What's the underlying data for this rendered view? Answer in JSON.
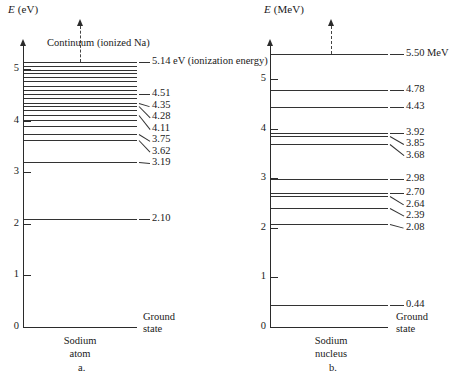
{
  "figure": {
    "background": "#ffffff",
    "line_color": "#333333",
    "axis_color": "#2b2b2b"
  },
  "chart_data": [
    {
      "type": "line",
      "id": "sodium-atom-levels",
      "title": "",
      "panel_letter": "a.",
      "ylabel_italic": "E",
      "ylabel_unit": "(eV)",
      "xlabel_line1": "Sodium",
      "xlabel_line2": "atom",
      "ylim": [
        0,
        5.6
      ],
      "yticks": [
        0,
        1,
        2,
        3,
        4,
        5
      ],
      "ytick_labels": [
        "0",
        "1",
        "2",
        "3",
        "4",
        "5"
      ],
      "grid": false,
      "legend": "none",
      "annotation_continuum": "Continuum (ionized Na)",
      "annotation_ground": "Ground\nstate",
      "ground_state_value": 0,
      "labeled_levels": [
        {
          "value": 5.14,
          "label": "5.14 eV (ionization energy)"
        },
        {
          "value": 4.51,
          "label": "4.51"
        },
        {
          "value": 4.35,
          "label": "4.35"
        },
        {
          "value": 4.28,
          "label": "4.28"
        },
        {
          "value": 4.11,
          "label": "4.11"
        },
        {
          "value": 3.75,
          "label": "3.75"
        },
        {
          "value": 3.62,
          "label": "3.62"
        },
        {
          "value": 3.19,
          "label": "3.19"
        },
        {
          "value": 2.1,
          "label": "2.10"
        }
      ],
      "unlabeled_levels": [
        5.05,
        4.98,
        4.92,
        4.85,
        4.77,
        4.68,
        4.6,
        4.43,
        4.21,
        4.02,
        3.9
      ],
      "values": [
        5.14,
        5.05,
        4.98,
        4.92,
        4.85,
        4.77,
        4.68,
        4.6,
        4.51,
        4.43,
        4.35,
        4.28,
        4.21,
        4.11,
        4.02,
        3.9,
        3.75,
        3.62,
        3.19,
        2.1,
        0
      ]
    },
    {
      "type": "line",
      "id": "sodium-nucleus-levels",
      "title": "",
      "panel_letter": "b.",
      "ylabel_italic": "E",
      "ylabel_unit": "(MeV)",
      "xlabel_line1": "Sodium",
      "xlabel_line2": "nucleus",
      "ylim": [
        0,
        5.9
      ],
      "yticks": [
        0,
        1,
        2,
        3,
        4,
        5
      ],
      "ytick_labels": [
        "0",
        "1",
        "2",
        "3",
        "4",
        "5"
      ],
      "grid": false,
      "legend": "none",
      "annotation_ground": "Ground\nstate",
      "ground_state_value": 0,
      "labeled_levels": [
        {
          "value": 5.5,
          "label": "5.50 MeV"
        },
        {
          "value": 4.78,
          "label": "4.78"
        },
        {
          "value": 4.43,
          "label": "4.43"
        },
        {
          "value": 3.92,
          "label": "3.92"
        },
        {
          "value": 3.85,
          "label": "3.85"
        },
        {
          "value": 3.68,
          "label": "3.68"
        },
        {
          "value": 2.98,
          "label": "2.98"
        },
        {
          "value": 2.7,
          "label": "2.70"
        },
        {
          "value": 2.64,
          "label": "2.64"
        },
        {
          "value": 2.39,
          "label": "2.39"
        },
        {
          "value": 2.08,
          "label": "2.08"
        },
        {
          "value": 0.44,
          "label": "0.44"
        }
      ],
      "unlabeled_levels": [],
      "values": [
        5.5,
        4.78,
        4.43,
        3.92,
        3.85,
        3.68,
        2.98,
        2.7,
        2.64,
        2.39,
        2.08,
        0.44,
        0
      ]
    }
  ]
}
